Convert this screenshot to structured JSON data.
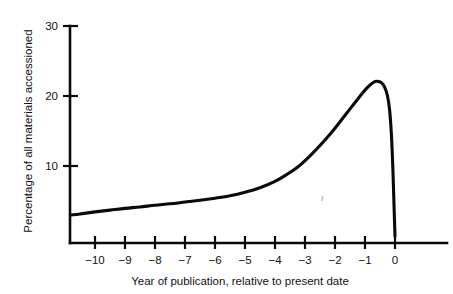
{
  "chart_data": {
    "type": "line",
    "title": "",
    "subtitle": "",
    "xlabel": "Year of publication, relative to present date",
    "ylabel": "Percentage of all materials accessioned",
    "xlim": [
      -10.8,
      -10.8
    ],
    "ylim": [
      0,
      30
    ],
    "grid": false,
    "legend": null,
    "x_ticks": [
      "−10",
      "−9",
      "−8",
      "−7",
      "−6",
      "−5",
      "−4",
      "−3",
      "−2",
      "−1",
      "0"
    ],
    "x_tick_values": [
      -10,
      -9,
      -8,
      -7,
      -6,
      -5,
      -4,
      -3,
      -2,
      -1,
      0
    ],
    "y_ticks": [
      "10",
      "20",
      "30"
    ],
    "y_tick_values": [
      10,
      20,
      30
    ],
    "x_axis_range": [
      -10.9,
      1.1
    ],
    "y_axis_range": [
      0,
      30
    ],
    "series": [
      {
        "name": "Percentage of all materials accessioned",
        "color": "#0a0a0a",
        "x": [
          -10.8,
          -10.5,
          -10.0,
          -9.5,
          -9.0,
          -8.5,
          -8.0,
          -7.5,
          -7.0,
          -6.5,
          -6.0,
          -5.5,
          -5.0,
          -4.5,
          -4.0,
          -3.6,
          -3.2,
          -2.8,
          -2.4,
          -2.0,
          -1.6,
          -1.2,
          -0.9,
          -0.7,
          -0.6,
          -0.45,
          -0.35,
          -0.25,
          -0.18,
          -0.12,
          -0.07,
          -0.03,
          0.0
        ],
        "y": [
          3.0,
          3.15,
          3.45,
          3.7,
          3.95,
          4.15,
          4.4,
          4.6,
          4.85,
          5.1,
          5.4,
          5.75,
          6.25,
          6.9,
          7.8,
          8.8,
          10.0,
          11.6,
          13.4,
          15.4,
          17.6,
          19.8,
          21.3,
          22.0,
          22.1,
          21.9,
          21.3,
          20.0,
          18.0,
          14.5,
          9.5,
          4.0,
          0.0
        ]
      }
    ],
    "annotations": []
  },
  "axes": {
    "y_axis_label": "Percentage of all materials accessioned",
    "x_axis_label": "Year of publication, relative to present date"
  },
  "colors": {
    "background": "#ffffff",
    "ink": "#0a0a0a",
    "text": "#111111"
  }
}
